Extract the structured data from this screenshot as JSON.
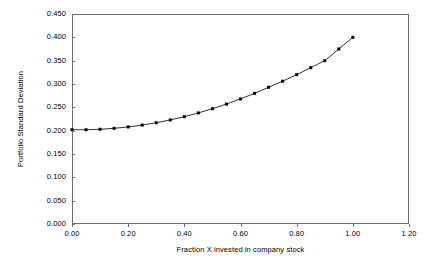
{
  "chart_data": {
    "type": "line",
    "title": "",
    "subtitle": "",
    "xlabel": "Fraction X invested in company stock",
    "ylabel": "Portfolio Standard Deviation",
    "xlim": [
      0.0,
      1.2
    ],
    "ylim": [
      0.0,
      0.45
    ],
    "xticks": [
      "0.00",
      "0.20",
      "0.40",
      "0.60",
      "0.80",
      "1.00",
      "1.20"
    ],
    "xtick_values": [
      0.0,
      0.2,
      0.4,
      0.6,
      0.8,
      1.0,
      1.2
    ],
    "yticks": [
      "0.000",
      "0.050",
      "0.100",
      "0.150",
      "0.200",
      "0.250",
      "0.300",
      "0.350",
      "0.400",
      "0.450"
    ],
    "ytick_values": [
      0.0,
      0.05,
      0.1,
      0.15,
      0.2,
      0.25,
      0.3,
      0.35,
      0.4,
      0.45
    ],
    "grid": false,
    "legend": false,
    "legend_position": "none",
    "marker": "square",
    "marker_color": "#000000",
    "line_color": "#000000",
    "series": [
      {
        "name": "Portfolio Standard Deviation",
        "x": [
          0.0,
          0.05,
          0.1,
          0.15,
          0.2,
          0.25,
          0.3,
          0.35,
          0.4,
          0.45,
          0.5,
          0.55,
          0.6,
          0.65,
          0.7,
          0.75,
          0.8,
          0.85,
          0.9,
          0.95,
          1.0
        ],
        "values": [
          0.202,
          0.202,
          0.203,
          0.205,
          0.208,
          0.212,
          0.217,
          0.223,
          0.23,
          0.238,
          0.247,
          0.257,
          0.268,
          0.28,
          0.293,
          0.306,
          0.32,
          0.335,
          0.35,
          0.375,
          0.4
        ]
      }
    ]
  }
}
